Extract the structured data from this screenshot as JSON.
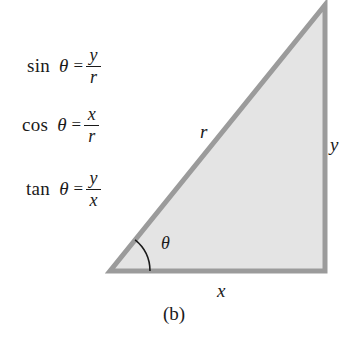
{
  "figure": {
    "caption": "(b)",
    "colors": {
      "triangle_fill": "#e4e4e4",
      "triangle_stroke": "#9b9b9b",
      "text": "#1a1a1a",
      "background": "#ffffff"
    }
  },
  "formulas": [
    {
      "id": "sine",
      "function": "sin",
      "angle": "θ",
      "equals": "=",
      "numerator": "y",
      "denominator": "r"
    },
    {
      "id": "cosine",
      "function": "cos",
      "angle": "θ",
      "equals": "=",
      "numerator": "x",
      "denominator": "r"
    },
    {
      "id": "tangent",
      "function": "tan",
      "angle": "θ",
      "equals": "=",
      "numerator": "y",
      "denominator": "x"
    }
  ],
  "triangle": {
    "labels": {
      "hypotenuse": "r",
      "opposite": "y",
      "adjacent": "x",
      "angle": "θ"
    },
    "vertices": {
      "bottom_left": [
        110,
        271
      ],
      "bottom_right": [
        325,
        271
      ],
      "top_right": [
        325,
        5
      ]
    }
  }
}
